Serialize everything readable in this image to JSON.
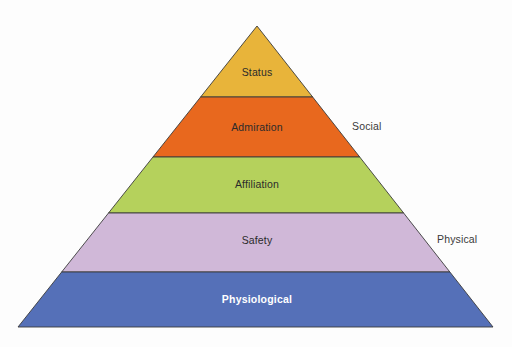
{
  "diagram": {
    "type": "pyramid",
    "title": "",
    "background_color": "#fdfdfd",
    "outline_color": "#3b3b3b",
    "apex": {
      "x": 257,
      "y": 26
    },
    "base": {
      "left_x": 18,
      "right_x": 493,
      "y": 327
    },
    "tiers": [
      {
        "label": "Status",
        "color": "#e8b43a",
        "text_color": "#2b2b2b",
        "bold": false,
        "top_y": 26,
        "bottom_y": 97,
        "label_y": 73
      },
      {
        "label": "Admiration",
        "color": "#e8681e",
        "text_color": "#2b2b2b",
        "bold": false,
        "top_y": 97,
        "bottom_y": 157,
        "label_y": 128
      },
      {
        "label": "Affiliation",
        "color": "#b5d15c",
        "text_color": "#2b2b2b",
        "bold": false,
        "top_y": 157,
        "bottom_y": 213,
        "label_y": 185
      },
      {
        "label": "Safety",
        "color": "#d0b8d8",
        "text_color": "#2b2b2b",
        "bold": false,
        "top_y": 213,
        "bottom_y": 272,
        "label_y": 241
      },
      {
        "label": "Physiological",
        "color": "#5570b8",
        "text_color": "#ffffff",
        "bold": true,
        "top_y": 272,
        "bottom_y": 327,
        "label_y": 300
      }
    ],
    "side_labels": [
      {
        "text": "Social",
        "x": 352,
        "y": 127
      },
      {
        "text": "Physical",
        "x": 437,
        "y": 240
      }
    ]
  }
}
